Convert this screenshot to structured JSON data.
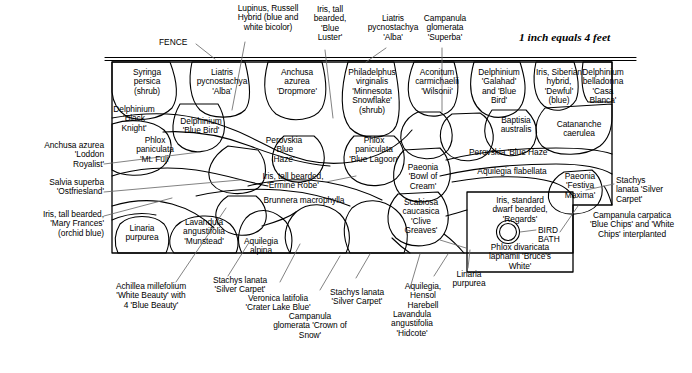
{
  "scale_note": "1 inch equals 4 feet",
  "fence_label": "FENCE",
  "bird_bath_label": "BIRD\nBATH",
  "colors": {
    "line": "#000000",
    "background": "#ffffff",
    "leader": "#555555"
  },
  "beds": [
    {
      "id": "syringa",
      "name": "Syringa\npersica\n(shrub)"
    },
    {
      "id": "liatris-alba",
      "name": "Liatris\npycnostachya\n'Alba'"
    },
    {
      "id": "anchusa-drop",
      "name": "Anchusa\nazurea\n'Dropmore'"
    },
    {
      "id": "philadelphus",
      "name": "Philadelphus\nvirginalis\n'Minnesota\nSnowflake'\n(shrub)"
    },
    {
      "id": "aconitum",
      "name": "Aconitum\ncarmichaelii\n'Wilsonii'"
    },
    {
      "id": "delph-galahad",
      "name": "Delphinium\n'Galahad'\nand 'Blue\nBird'"
    },
    {
      "id": "iris-siberian",
      "name": "Iris, Siberian\nhybrid,\n'Dewful'\n(blue)"
    },
    {
      "id": "delph-casa",
      "name": "Delphinium\nbelladonna\n'Casa\nBlanca'"
    },
    {
      "id": "delph-black",
      "name": "Delphinium\n'Black\nKnight'"
    },
    {
      "id": "delph-bluebird",
      "name": "Delphinium\n'Blue Bird'"
    },
    {
      "id": "phlox-mtfuji",
      "name": "Phlox\npaniculata\n'Mt. Fuji'"
    },
    {
      "id": "perovskia-bh",
      "name": "Perovskia\n'Blue\nHaze'"
    },
    {
      "id": "phlox-lagoon",
      "name": "Phlox\npaniculata\n'Blue Lagoon'"
    },
    {
      "id": "baptisia",
      "name": "Baptisia\naustralis"
    },
    {
      "id": "catananche",
      "name": "Catananche\ncaerulea"
    },
    {
      "id": "perovskia-bh2",
      "name": "Perovskia 'Blue Haze'"
    },
    {
      "id": "aquilegia-flab",
      "name": "Aquilegia flabellata"
    },
    {
      "id": "paeonia-bowl",
      "name": "Paeonia\n'Bowl of\nCream'"
    },
    {
      "id": "paeonia-festiva",
      "name": "Paeonia\n'Festiva\nMaxima'"
    },
    {
      "id": "iris-ermine",
      "name": "Iris, tall bearded,\n'Ermine Robe'"
    },
    {
      "id": "brunnera",
      "name": "Brunnera macrophylla"
    },
    {
      "id": "scabiosa",
      "name": "Scabiosa\ncaucasica\n'Clive\nGreaves'"
    },
    {
      "id": "linaria",
      "name": "Linaria\npurpurea"
    },
    {
      "id": "lavandula-mun",
      "name": "Lavandula\nangustifolia\n'Munstead'"
    },
    {
      "id": "aquilegia-alp",
      "name": "Aquilegia\nalpina"
    },
    {
      "id": "iris-regards",
      "name": "Iris, standard\ndwarf bearded,\n'Regards'"
    },
    {
      "id": "phlox-bruce",
      "name": "Phlox divaricata\nlaphamii 'Bruce's\nWhite'"
    }
  ],
  "callouts": {
    "top": [
      {
        "id": "lupinus",
        "name": "Lupinus, Russell\nHybrid (blue and\nwhite bicolor)"
      },
      {
        "id": "iris-blue-luster",
        "name": "Iris, tall\nbearded,\n'Blue\nLuster'"
      },
      {
        "id": "liatris-alba-top",
        "name": "Liatris\npycnostachya\n'Alba'"
      },
      {
        "id": "campanula-superba",
        "name": "Campanula\nglomerata\n'Superba'"
      }
    ],
    "left": [
      {
        "id": "anchusa-loddon",
        "name": "Anchusa azurea\n'Loddon\nRoyalist'"
      },
      {
        "id": "salvia-ost",
        "name": "Salvia superba\n'Ostfriesland'"
      },
      {
        "id": "iris-mary",
        "name": "Iris, tall bearded,\n'Mary Frances'\n(orchid blue)"
      }
    ],
    "right": [
      {
        "id": "stachys-right",
        "name": "Stachys\nlanata 'Silver\nCarpet'"
      },
      {
        "id": "campanula-carp",
        "name": "Campanula carpatica\n'Blue Chips' and 'White\nChips' interplanted"
      }
    ],
    "bottom": [
      {
        "id": "achillea",
        "name": "Achillea millefolium\n'White Beauty' with\n4 'Blue Beauty'"
      },
      {
        "id": "stachys-b1",
        "name": "Stachys lanata\n'Silver Carpet'"
      },
      {
        "id": "veronica",
        "name": "Veronica latifolia\n'Crater Lake Blue'"
      },
      {
        "id": "campanula-crown",
        "name": "Campanula\nglomerata 'Crown of\nSnow'"
      },
      {
        "id": "stachys-b2",
        "name": "Stachys lanata\n'Silver Carpet'"
      },
      {
        "id": "lavandula-hid",
        "name": "Lavandula\nangustifolia\n'Hidcote'"
      },
      {
        "id": "aquilegia-hensol",
        "name": "Aquilegia,\nHensol\nHarebell"
      },
      {
        "id": "linaria-b",
        "name": "Linaria\npurpurea"
      }
    ]
  }
}
